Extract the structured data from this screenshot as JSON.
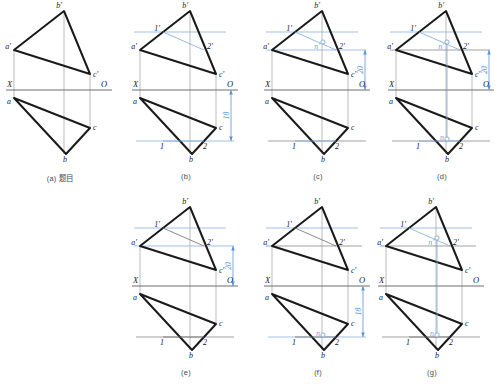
{
  "figure": {
    "kind": "descriptive-geometry-construction",
    "colors": {
      "outline": "#1a1a1a",
      "axis": "#6e6e6e",
      "auxiliary": "#7da7d9",
      "dimension": "#5b93d6",
      "caption": "#4a4a4a"
    }
  },
  "panels": [
    {
      "id": "a",
      "caption": "(a) 题目",
      "labels": {
        "b_prime": "b'",
        "a_prime": "a'",
        "c_prime": "c'",
        "X": "X",
        "O": "O",
        "a": "a",
        "c": "c",
        "b": "b"
      }
    },
    {
      "id": "b",
      "caption": "(b)",
      "labels": {
        "b_prime": "b'",
        "a_prime": "a'",
        "c_prime": "c'",
        "one_prime": "1'",
        "two_prime": "2'",
        "X": "X",
        "O": "O",
        "a": "a",
        "c": "c",
        "b": "b",
        "one": "1",
        "two": "2"
      },
      "dimension": "18"
    },
    {
      "id": "c",
      "caption": "(c)",
      "labels": {
        "b_prime": "b'",
        "a_prime": "a'",
        "c_prime": "c'",
        "one_prime": "1'",
        "two_prime": "2'",
        "n_prime": "n'",
        "X": "X",
        "O": "O",
        "a": "a",
        "c": "c",
        "b": "b",
        "one": "1",
        "two": "2"
      },
      "dimension": "20"
    },
    {
      "id": "d",
      "caption": "(d)",
      "labels": {
        "b_prime": "b'",
        "a_prime": "a'",
        "c_prime": "c'",
        "one_prime": "1'",
        "two_prime": "2'",
        "n_prime": "n'",
        "X": "X",
        "O": "O",
        "a": "a",
        "c": "c",
        "b": "b",
        "n": "n",
        "one": "1",
        "two": "2"
      },
      "dimension": "20"
    },
    {
      "id": "e",
      "caption": "(e)",
      "labels": {
        "b_prime": "b'",
        "a_prime": "a'",
        "c_prime": "c'",
        "one_prime": "1'",
        "two_prime": "2'",
        "X": "X",
        "O": "O",
        "a": "a",
        "c": "c",
        "b": "b",
        "one": "1",
        "two": "2"
      },
      "dimension": "20"
    },
    {
      "id": "f",
      "caption": "(f)",
      "labels": {
        "b_prime": "b'",
        "a_prime": "a'",
        "c_prime": "c'",
        "one_prime": "1'",
        "two_prime": "2'",
        "X": "X",
        "O": "O",
        "a": "a",
        "c": "c",
        "b": "b",
        "n": "n",
        "one": "1",
        "two": "2"
      },
      "dimension": "18"
    },
    {
      "id": "g",
      "caption": "(g)",
      "labels": {
        "b_prime": "b'",
        "a_prime": "a'",
        "c_prime": "c'",
        "one_prime": "1'",
        "two_prime": "2'",
        "n_prime": "n'",
        "X": "X",
        "O": "O",
        "a": "a",
        "c": "c",
        "b": "b",
        "n": "n",
        "one": "1",
        "two": "2"
      }
    }
  ],
  "geometry": {
    "note": "normalized panel coordinates, panel box 112 x 162",
    "a_prime": [
      10,
      48
    ],
    "b_prime": [
      60,
      9
    ],
    "c_prime": [
      86,
      72
    ],
    "a": [
      10,
      96
    ],
    "b": [
      62,
      152
    ],
    "c": [
      86,
      126
    ],
    "axis_y": 88,
    "one_prime": [
      33,
      30
    ],
    "two_prime": [
      74,
      48
    ],
    "one": [
      33,
      139
    ],
    "two": [
      74,
      139
    ],
    "n_prime": [
      61,
      40
    ],
    "n": [
      61,
      137
    ]
  }
}
